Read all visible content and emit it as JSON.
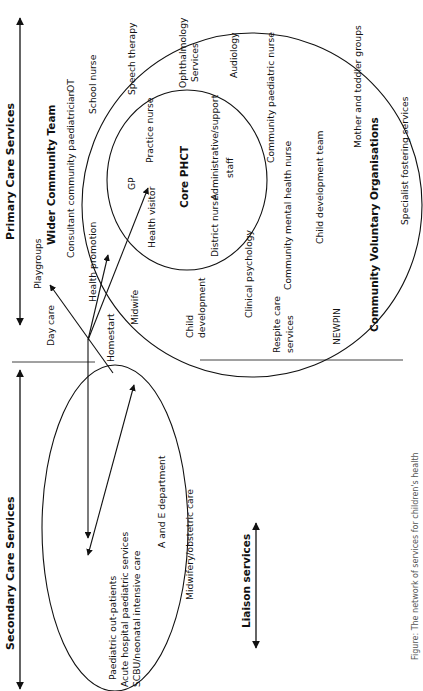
{
  "diagram": {
    "orientation": "rotated 90° counter-clockwise (text reads bottom-to-top)",
    "axes": {
      "primary_care": {
        "label": "Primary Care Services",
        "arrow": "double-headed"
      },
      "secondary_care": {
        "label": "Secondary Care Services",
        "arrow": "double-headed"
      },
      "liaison": {
        "label": "Liaison services",
        "arrow": "double-headed"
      }
    },
    "core_phct": {
      "title": "Core PHCT",
      "items": [
        "GP",
        "Practice nurse",
        "Health visitor",
        "District nurse",
        "Administrative/support",
        "staff"
      ]
    },
    "wider_team": {
      "title": "Wider Community Team",
      "items": [
        "Consultant community paediatrician",
        "OT",
        "School nurse",
        "Speech therapy",
        "Ophthalmology",
        "Services",
        "Audiology",
        "Community paediatric nurse",
        "Child development team",
        "Community mental health nurse",
        "Clinical psychology",
        "Child",
        "development",
        "Midwife",
        "Health promotion"
      ]
    },
    "voluntary": {
      "title": "Community Voluntary Organisations",
      "items": [
        "Mother and toddler groups",
        "Specialist fostering services",
        "NEWPIN",
        "Respite care",
        "services",
        "Playgroups",
        "Day care",
        "Homestart"
      ]
    },
    "secondary": {
      "items": [
        "Paediatric out-patients",
        "Acute hospital paediatric services",
        "SCBU/neonatal intensive care",
        "A and E department",
        "Midwifery/obstetric care"
      ]
    },
    "caption": "Figure: The network of services for children's health"
  }
}
